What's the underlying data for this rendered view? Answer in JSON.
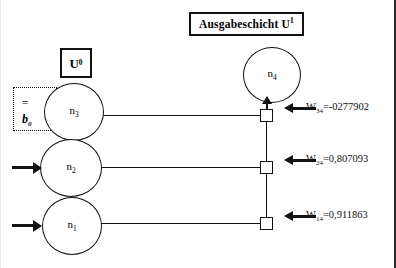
{
  "diagram": {
    "title_box": {
      "text": "Ausgabeschicht U",
      "superscript": "1"
    },
    "layer_box": {
      "text": "U",
      "superscript": "0"
    },
    "bias_box": {
      "equals": "=",
      "symbol": "b",
      "subscript": "0"
    },
    "neurons": [
      {
        "name": "n4-node",
        "base": "n",
        "index": "4"
      },
      {
        "name": "n3-node",
        "base": "n",
        "index": "3"
      },
      {
        "name": "n2-node",
        "base": "n",
        "index": "2"
      },
      {
        "name": "n1-node",
        "base": "n",
        "index": "1"
      }
    ],
    "weights": [
      {
        "name": "w34",
        "symbol": "W",
        "subscript": "34",
        "equals": "=",
        "value": "-0277902",
        "full": "W34=-0277902"
      },
      {
        "name": "w24",
        "symbol": "W",
        "subscript": "24",
        "equals": "=",
        "value": "0,807093",
        "full": "W24=0,807093"
      },
      {
        "name": "w14",
        "symbol": "W",
        "subscript": "14",
        "equals": "=",
        "value": "0,911863",
        "full": "W14=0,911863"
      }
    ],
    "colors": {
      "ink": "#111111",
      "background": "#ffffff"
    }
  }
}
